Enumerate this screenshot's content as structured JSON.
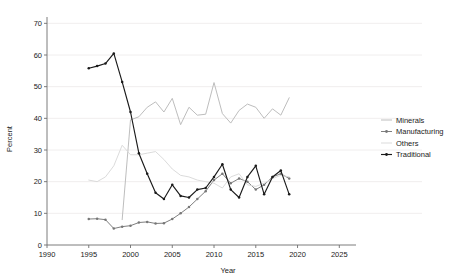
{
  "chart_data": {
    "type": "line",
    "title": "",
    "xlabel": "Year",
    "ylabel": "Percent",
    "xlim": [
      1990,
      2027
    ],
    "ylim": [
      0,
      72
    ],
    "xticks": [
      1990,
      1995,
      2000,
      2005,
      2010,
      2015,
      2020,
      2025
    ],
    "yticks": [
      0,
      10,
      20,
      30,
      40,
      50,
      60,
      70
    ],
    "grid": "horizontal",
    "legend_position": "right",
    "series": [
      {
        "name": "Minerals",
        "color": "#b9b9b9",
        "marker": "none",
        "x": [
          1999,
          2000,
          2001,
          2002,
          2003,
          2004,
          2005,
          2006,
          2007,
          2008,
          2009,
          2010,
          2011,
          2012,
          2013,
          2014,
          2015,
          2016,
          2017,
          2018,
          2019
        ],
        "y": [
          8.0,
          39.5,
          40.5,
          43.5,
          45.2,
          42.0,
          46.3,
          38.0,
          43.5,
          41.0,
          41.3,
          51.3,
          41.5,
          38.5,
          42.5,
          44.5,
          43.5,
          40.0,
          43.0,
          41.0,
          46.5
        ]
      },
      {
        "name": "Manufacturing",
        "color": "#777777",
        "marker": "circle",
        "x": [
          1995,
          1996,
          1997,
          1998,
          1999,
          2000,
          2001,
          2002,
          2003,
          2004,
          2005,
          2006,
          2007,
          2008,
          2009,
          2010,
          2011,
          2012,
          2013,
          2014,
          2015,
          2016,
          2017,
          2018,
          2019
        ],
        "y": [
          8.2,
          8.3,
          8.0,
          5.2,
          5.8,
          6.1,
          7.1,
          7.3,
          6.8,
          6.9,
          8.2,
          10.0,
          12.0,
          14.5,
          17.0,
          20.5,
          22.5,
          19.5,
          21.0,
          20.0,
          17.5,
          19.0,
          21.5,
          22.5,
          21.0
        ]
      },
      {
        "name": "Others",
        "color": "#d9d9d9",
        "marker": "none",
        "x": [
          1995,
          1996,
          1997,
          1998,
          1999,
          2000,
          2001,
          2002,
          2003,
          2004,
          2005,
          2006,
          2007,
          2008,
          2009,
          2010,
          2011,
          2012,
          2013,
          2014,
          2015,
          2016,
          2017,
          2018,
          2019
        ],
        "y": [
          20.5,
          20.0,
          21.5,
          25.0,
          31.5,
          28.5,
          28.5,
          29.0,
          29.5,
          27.0,
          24.0,
          22.0,
          21.5,
          20.5,
          20.0,
          19.5,
          18.0,
          21.5,
          22.5,
          19.0,
          18.5,
          19.5,
          21.0,
          22.0,
          21.5
        ]
      },
      {
        "name": "Traditional",
        "color": "#1a1a1a",
        "marker": "circle",
        "x": [
          1995,
          1996,
          1997,
          1998,
          1999,
          2000,
          2001,
          2002,
          2003,
          2004,
          2005,
          2006,
          2007,
          2008,
          2009,
          2010,
          2011,
          2012,
          2013,
          2014,
          2015,
          2016,
          2017,
          2018,
          2019
        ],
        "y": [
          55.8,
          56.5,
          57.3,
          60.5,
          51.5,
          42.0,
          29.0,
          22.5,
          16.5,
          14.5,
          19.0,
          15.5,
          15.0,
          17.5,
          18.0,
          21.5,
          25.5,
          17.5,
          15.0,
          21.5,
          25.0,
          16.0,
          21.5,
          23.5,
          16.0
        ]
      }
    ],
    "legend": [
      {
        "label": "Minerals",
        "color": "#b9b9b9",
        "marker": "none"
      },
      {
        "label": "Manufacturing",
        "color": "#777777",
        "marker": "circle"
      },
      {
        "label": "Others",
        "color": "#d9d9d9",
        "marker": "none"
      },
      {
        "label": "Traditional",
        "color": "#1a1a1a",
        "marker": "circle"
      }
    ]
  }
}
